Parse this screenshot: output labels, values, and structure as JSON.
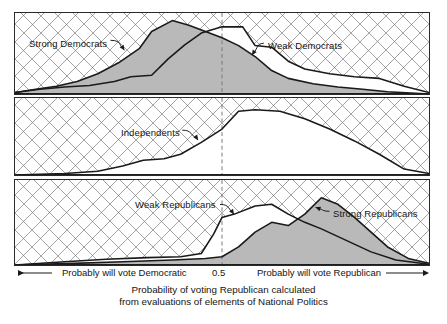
{
  "chart_data": {
    "type": "area",
    "title": "",
    "xlabel": "Probability of voting Republican calculated from evaluations of elements of National Politics",
    "ylabel": "",
    "xlim": [
      0,
      1
    ],
    "ylim": [
      0,
      1
    ],
    "grid": "cross-hatch-diagonal",
    "legend": "inline-annotations",
    "reference_line": {
      "x": 0.5,
      "label": "0.5",
      "style": "dashed"
    },
    "panels": [
      {
        "name": "panel-democrats",
        "series": [
          {
            "name": "Strong Democrats",
            "fill": "grey",
            "x": [
              0.0,
              0.05,
              0.1,
              0.15,
              0.2,
              0.25,
              0.3,
              0.33,
              0.38,
              0.42,
              0.46,
              0.5,
              0.54,
              0.58,
              0.62,
              0.66,
              0.72,
              0.78,
              0.84,
              0.9,
              1.0
            ],
            "y": [
              0.02,
              0.06,
              0.1,
              0.16,
              0.26,
              0.4,
              0.58,
              0.8,
              0.94,
              0.88,
              0.8,
              0.72,
              0.62,
              0.48,
              0.3,
              0.2,
              0.13,
              0.09,
              0.06,
              0.03,
              0.0
            ]
          },
          {
            "name": "Weak Democrats",
            "fill": "none",
            "x": [
              0.0,
              0.06,
              0.12,
              0.18,
              0.24,
              0.28,
              0.33,
              0.37,
              0.41,
              0.45,
              0.5,
              0.55,
              0.58,
              0.62,
              0.66,
              0.7,
              0.76,
              0.82,
              0.88,
              0.94,
              1.0
            ],
            "y": [
              0.02,
              0.06,
              0.09,
              0.11,
              0.16,
              0.22,
              0.24,
              0.45,
              0.63,
              0.78,
              0.86,
              0.86,
              0.62,
              0.6,
              0.42,
              0.32,
              0.26,
              0.22,
              0.2,
              0.1,
              0.02
            ]
          }
        ]
      },
      {
        "name": "panel-independents",
        "series": [
          {
            "name": "Independents",
            "fill": "none",
            "x": [
              0.0,
              0.12,
              0.2,
              0.26,
              0.31,
              0.36,
              0.4,
              0.45,
              0.5,
              0.54,
              0.58,
              0.64,
              0.7,
              0.76,
              0.82,
              0.88,
              0.94,
              1.0
            ],
            "y": [
              0.0,
              0.02,
              0.05,
              0.12,
              0.2,
              0.22,
              0.28,
              0.44,
              0.62,
              0.86,
              0.88,
              0.86,
              0.76,
              0.62,
              0.46,
              0.28,
              0.08,
              0.02
            ]
          }
        ]
      },
      {
        "name": "panel-republicans",
        "series": [
          {
            "name": "Weak Republicans",
            "fill": "none",
            "x": [
              0.0,
              0.12,
              0.22,
              0.32,
              0.4,
              0.45,
              0.48,
              0.5,
              0.53,
              0.58,
              0.62,
              0.66,
              0.7,
              0.74,
              0.8,
              0.86,
              0.92,
              1.0
            ],
            "y": [
              0.0,
              0.04,
              0.07,
              0.09,
              0.1,
              0.14,
              0.38,
              0.58,
              0.62,
              0.72,
              0.74,
              0.62,
              0.52,
              0.44,
              0.3,
              0.16,
              0.06,
              0.01
            ]
          },
          {
            "name": "Strong Republicans",
            "fill": "grey",
            "x": [
              0.0,
              0.14,
              0.26,
              0.38,
              0.46,
              0.5,
              0.54,
              0.58,
              0.62,
              0.66,
              0.7,
              0.74,
              0.78,
              0.82,
              0.86,
              0.9,
              0.95,
              1.0
            ],
            "y": [
              0.0,
              0.02,
              0.04,
              0.06,
              0.08,
              0.1,
              0.22,
              0.4,
              0.52,
              0.48,
              0.62,
              0.82,
              0.74,
              0.58,
              0.4,
              0.22,
              0.08,
              0.02
            ]
          }
        ]
      }
    ]
  },
  "panels": {
    "one": {
      "label_left": "Strong Democrats",
      "label_right": "Weak Democrats"
    },
    "two": {
      "label": "Independents"
    },
    "three": {
      "label_left": "Weak Republicans",
      "label_right": "Strong Republicans"
    }
  },
  "axis": {
    "left_label": "Probably will vote Democratic",
    "mid_label": "0.5",
    "right_label": "Probably will vote Republican"
  },
  "caption": {
    "line1": "Probability of voting Republican calculated",
    "line2": "from evaluations of elements of National Politics"
  },
  "footer": {
    "partial_text": ""
  },
  "colors": {
    "fill_grey": "#b9b9b9",
    "line": "#1a1a1a",
    "hatch": "#6e6e73",
    "frame": "#2a2a2a",
    "dashed": "#7a7a7a"
  }
}
